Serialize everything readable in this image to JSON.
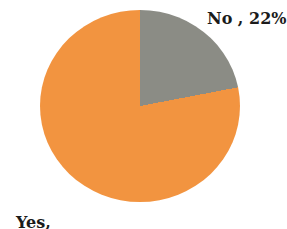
{
  "chart_data": {
    "type": "pie",
    "title": "",
    "categories": [
      "No",
      "Yes"
    ],
    "values": [
      22,
      78
    ],
    "unit": "%",
    "start_angle_deg": 0,
    "direction": "clockwise",
    "legend_position": "none",
    "background_color": "#ffffff",
    "label_color": "#1b1b1b",
    "slices": [
      {
        "name": "No",
        "value": 22,
        "color": "#8b8c85",
        "label": "No , 22%",
        "label_position": "top-right"
      },
      {
        "name": "Yes",
        "value": 78,
        "color": "#f29440",
        "label_line1": "Yes,",
        "label_line2": "78%",
        "label_position": "bottom-left"
      }
    ]
  }
}
